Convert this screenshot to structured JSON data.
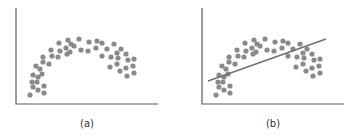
{
  "chart_data": [
    {
      "type": "scatter",
      "title": "",
      "caption": "(a)",
      "xlabel": "",
      "ylabel": "",
      "grid": false,
      "legend": null,
      "description": "Scatter points forming an inverted-U (arch) pattern",
      "points": [
        [
          30,
          95
        ],
        [
          33,
          87
        ],
        [
          38,
          90
        ],
        [
          44,
          93
        ],
        [
          44,
          86
        ],
        [
          32,
          82
        ],
        [
          37,
          82
        ],
        [
          33,
          75
        ],
        [
          38,
          77
        ],
        [
          42,
          74
        ],
        [
          36,
          66
        ],
        [
          40,
          69
        ],
        [
          43,
          62
        ],
        [
          49,
          64
        ],
        [
          43,
          57
        ],
        [
          52,
          56
        ],
        [
          51,
          50
        ],
        [
          58,
          57
        ],
        [
          60,
          51
        ],
        [
          59,
          43
        ],
        [
          67,
          54
        ],
        [
          66,
          48
        ],
        [
          68,
          40
        ],
        [
          71,
          44
        ],
        [
          74,
          46
        ],
        [
          70,
          52
        ],
        [
          79,
          39
        ],
        [
          81,
          50
        ],
        [
          88,
          51
        ],
        [
          89,
          42
        ],
        [
          97,
          41
        ],
        [
          96,
          48
        ],
        [
          102,
          43
        ],
        [
          107,
          49
        ],
        [
          114,
          44
        ],
        [
          102,
          56
        ],
        [
          111,
          57
        ],
        [
          117,
          53
        ],
        [
          121,
          49
        ],
        [
          126,
          54
        ],
        [
          118,
          58
        ],
        [
          128,
          60
        ],
        [
          134,
          59
        ],
        [
          110,
          67
        ],
        [
          117,
          64
        ],
        [
          120,
          71
        ],
        [
          126,
          68
        ],
        [
          133,
          66
        ],
        [
          127,
          76
        ],
        [
          134,
          73
        ]
      ]
    },
    {
      "type": "scatter",
      "title": "",
      "caption": "(b)",
      "xlabel": "",
      "ylabel": "",
      "grid": false,
      "legend": null,
      "description": "Same arch-shaped scatter with a straight linear fit line overlaid",
      "x_offset": 186,
      "fit_line": {
        "x1": 208,
        "y1": 81,
        "x2": 326,
        "y2": 39
      }
    }
  ],
  "colors": {
    "dot": "#8a8a8a",
    "axis": "#5a5a5a",
    "fit_line": "#707070",
    "label": "#333333"
  },
  "panels": [
    {
      "caption": "(a)"
    },
    {
      "caption": "(b)"
    }
  ]
}
